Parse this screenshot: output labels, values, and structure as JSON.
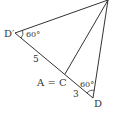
{
  "diagram": {
    "type": "geometry",
    "points": {
      "top": {
        "label": "",
        "x": 108,
        "y": 0
      },
      "D_prime": {
        "label": "D′",
        "x": 15,
        "y": 33
      },
      "C": {
        "label": "A = C",
        "x": 65,
        "y": 74
      },
      "D": {
        "label": "D",
        "x": 93,
        "y": 98
      }
    },
    "segments": [
      {
        "from": "top",
        "to": "D_prime"
      },
      {
        "from": "top",
        "to": "C"
      },
      {
        "from": "top",
        "to": "D"
      },
      {
        "from": "D_prime",
        "to": "D"
      }
    ],
    "labels": {
      "d_prime": "D′",
      "d": "D",
      "a_eq_c": "A = C",
      "angle_d_prime": "60°",
      "angle_d": "60°",
      "len_d_prime_c": "5",
      "len_c_d": "3"
    },
    "colors": {
      "stroke": "#333333",
      "background": "#ffffff"
    }
  }
}
